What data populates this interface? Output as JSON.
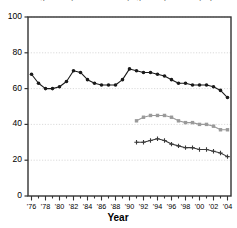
{
  "chart_data": {
    "type": "line",
    "title": "Percentage of Boys and Girls Playing Varsity or Varsity Sports",
    "xlabel": "Year",
    "ylabel": "",
    "ylim": [
      0,
      100
    ],
    "yticks": [
      0,
      20,
      40,
      60,
      80,
      100
    ],
    "xlim": [
      1975.5,
      2004.5
    ],
    "xticks": [
      "'76",
      "'78",
      "'80",
      "'82",
      "'84",
      "'86",
      "'88",
      "'90",
      "'92",
      "'94",
      "'96",
      "'98",
      "'00",
      "'02",
      "'04"
    ],
    "xtick_values": [
      1976,
      1978,
      1980,
      1982,
      1984,
      1986,
      1988,
      1990,
      1992,
      1994,
      1996,
      1998,
      2000,
      2002,
      2004
    ],
    "grid": true,
    "grid_axis": "y",
    "legend": "none",
    "series": [
      {
        "name": "series-1-top",
        "color": "#1a1a1a",
        "marker": "circle",
        "x": [
          1976,
          1977,
          1978,
          1979,
          1980,
          1981,
          1982,
          1983,
          1984,
          1985,
          1986,
          1987,
          1988,
          1989,
          1990,
          1991,
          1992,
          1993,
          1994,
          1995,
          1996,
          1997,
          1998,
          1999,
          2000,
          2001,
          2002,
          2003,
          2004
        ],
        "values": [
          68,
          63,
          60,
          60,
          61,
          64,
          70,
          69,
          65,
          63,
          62,
          62,
          62,
          65,
          71,
          70,
          69,
          69,
          68,
          67,
          65,
          63,
          63,
          62,
          62,
          62,
          61,
          59,
          55
        ]
      },
      {
        "name": "series-2-middle",
        "color": "#9a9a9a",
        "marker": "square",
        "x": [
          1991,
          1992,
          1993,
          1994,
          1995,
          1996,
          1997,
          1998,
          1999,
          2000,
          2001,
          2002,
          2003,
          2004
        ],
        "values": [
          42,
          44,
          45,
          45,
          45,
          44,
          42,
          41,
          41,
          40,
          40,
          39,
          37,
          37
        ]
      },
      {
        "name": "series-3-bottom",
        "color": "#3a3a3a",
        "marker": "plus",
        "x": [
          1991,
          1992,
          1993,
          1994,
          1995,
          1996,
          1997,
          1998,
          1999,
          2000,
          2001,
          2002,
          2003,
          2004
        ],
        "values": [
          30,
          30,
          31,
          32,
          31,
          29,
          28,
          27,
          27,
          26,
          26,
          25,
          24,
          22
        ]
      }
    ]
  },
  "axes": {
    "y_tick_labels": [
      "100",
      "80",
      "60",
      "40",
      "20",
      "0"
    ],
    "x_tick_labels": [
      "'76",
      "'78",
      "'80",
      "'82",
      "'84",
      "'86",
      "'88",
      "'90",
      "'92",
      "'94",
      "'96",
      "'98",
      "'00",
      "'02",
      "'04"
    ],
    "x_axis_title": "Year"
  },
  "colors": {
    "series1": "#1a1a1a",
    "series2": "#9a9a9a",
    "series3": "#3a3a3a",
    "grid": "#cccccc",
    "frame": "#333333"
  }
}
